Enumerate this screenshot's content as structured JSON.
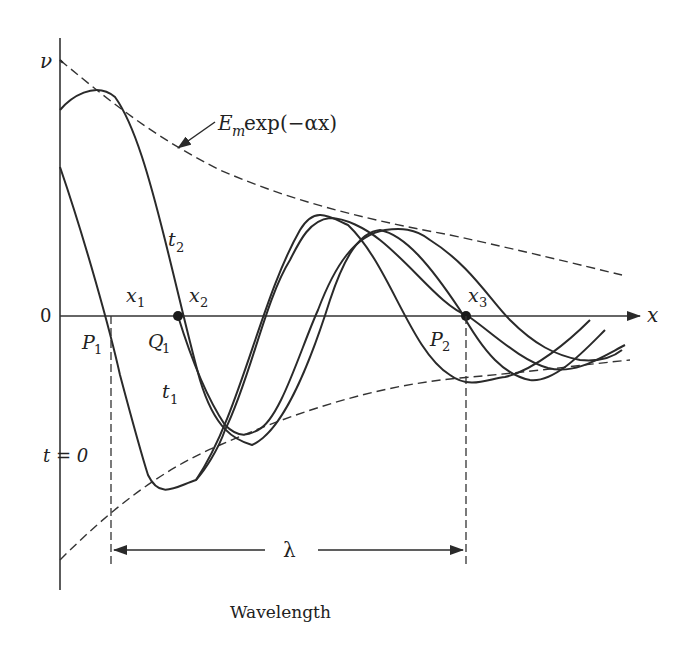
{
  "diagram": {
    "axes": {
      "y_label": "ν",
      "x_label": "x",
      "origin_label": "0"
    },
    "envelope": {
      "label_main": "E",
      "label_sub": "m",
      "label_rest": " exp(−αx)"
    },
    "time_labels": {
      "t0": "t = 0",
      "t1_main": "t",
      "t1_sub": "1",
      "t2_main": "t",
      "t2_sub": "2"
    },
    "points": {
      "x1_main": "x",
      "x1_sub": "1",
      "x2_main": "x",
      "x2_sub": "2",
      "x3_main": "x",
      "x3_sub": "3",
      "P1_main": "P",
      "P1_sub": "1",
      "Q1_main": "Q",
      "Q1_sub": "1",
      "P2_main": "P",
      "P2_sub": "2"
    },
    "wavelength": {
      "symbol": "λ",
      "caption": "Wavelength"
    }
  },
  "colors": {
    "ink": "#2a2a2a",
    "background": "#ffffff"
  }
}
